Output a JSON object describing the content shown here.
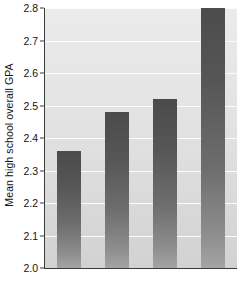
{
  "chart_data": {
    "type": "bar",
    "title": "",
    "subtitle": "",
    "xlabel": "",
    "ylabel": "Mean high school overall GPA",
    "categories": [
      "",
      "",
      "",
      ""
    ],
    "values": [
      2.36,
      2.48,
      2.52,
      2.82
    ],
    "ylim": [
      2.0,
      2.8
    ],
    "ytick_labels": [
      "2.0",
      "2.1",
      "2.2",
      "2.3",
      "2.4",
      "2.5",
      "2.6",
      "2.7",
      "2.8"
    ],
    "ytick_values": [
      2.0,
      2.1,
      2.2,
      2.3,
      2.4,
      2.5,
      2.6,
      2.7,
      2.8
    ],
    "xtick_labels": [],
    "grid": "horizontal",
    "legend": "none",
    "bar_color": "#5a5a5a",
    "plot_background": "#e6e6e6",
    "gridline_color": "#fcfcfc",
    "axis_color": "#3c3c3c",
    "annotations": []
  }
}
